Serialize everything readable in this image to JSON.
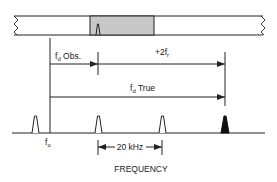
{
  "diagram": {
    "type": "frequency-domain Doppler ambiguity diagram",
    "colors": {
      "line": "#222222",
      "passband_fill": "#c8c8c8",
      "true_pulse_fill": "#111111"
    },
    "filter_bar": {
      "description": "filter bank strip with shaded passband containing observed line"
    },
    "labels": {
      "fd_obs_main": "f",
      "fd_obs_sub": "d",
      "fd_obs_suffix": " Obs.",
      "plus_2fr_main": "+2f",
      "plus_2fr_sub": "r",
      "fd_true_main": "f",
      "fd_true_sub": "d",
      "fd_true_suffix": " True",
      "f0_main": "f",
      "f0_sub": "o",
      "spacing": "20 kHz",
      "axis_label": "FREQUENCY"
    },
    "spectral_lines": [
      {
        "name": "line-1",
        "x": 35,
        "filled": false
      },
      {
        "name": "line-2-observed",
        "x": 98,
        "filled": false
      },
      {
        "name": "line-3",
        "x": 162,
        "filled": false
      },
      {
        "name": "line-4-true",
        "x": 225,
        "filled": true
      }
    ]
  }
}
